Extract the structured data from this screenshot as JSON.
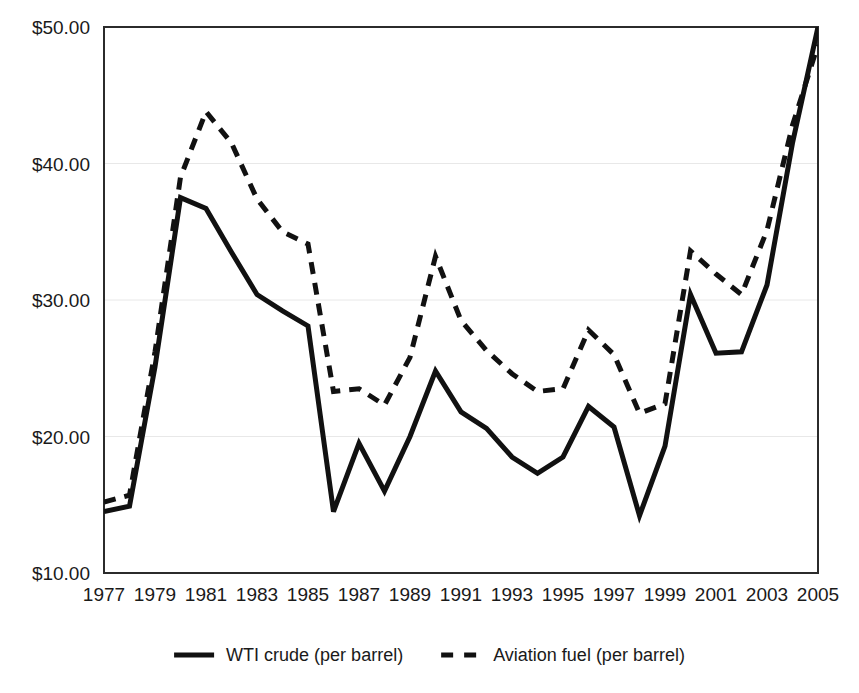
{
  "chart_data": {
    "type": "line",
    "title": "",
    "subtitle": "",
    "xlabel": "",
    "ylabel": "",
    "xlim": [
      1977,
      2005
    ],
    "ylim": [
      10,
      50
    ],
    "y_tick_labels": [
      "$50.00",
      "$40.00",
      "$30.00",
      "$20.00",
      "$10.00"
    ],
    "y_ticks": [
      50,
      40,
      30,
      20,
      10
    ],
    "x_tick_labels": [
      "1977",
      "1979",
      "1981",
      "1983",
      "1985",
      "1987",
      "1989",
      "1991",
      "1993",
      "1995",
      "1997",
      "1999",
      "2001",
      "2003",
      "2005"
    ],
    "x_ticks": [
      1977,
      1979,
      1981,
      1983,
      1985,
      1987,
      1989,
      1991,
      1993,
      1995,
      1997,
      1999,
      2001,
      2003,
      2005
    ],
    "x": [
      1977,
      1978,
      1979,
      1980,
      1981,
      1982,
      1983,
      1984,
      1985,
      1986,
      1987,
      1988,
      1989,
      1990,
      1991,
      1992,
      1993,
      1994,
      1995,
      1996,
      1997,
      1998,
      1999,
      2000,
      2001,
      2002,
      2003,
      2004,
      2005
    ],
    "grid": true,
    "grid_axis": "y",
    "legend_position": "bottom",
    "series": [
      {
        "name": "WTI crude (per barrel)",
        "style": "solid",
        "color": "#111111",
        "values": [
          14.5,
          14.9,
          25.1,
          37.5,
          36.7,
          33.5,
          30.4,
          29.2,
          28.1,
          14.5,
          19.5,
          16.0,
          20.0,
          24.8,
          21.8,
          20.6,
          18.5,
          17.3,
          18.5,
          22.2,
          20.7,
          14.2,
          19.3,
          30.4,
          26.1,
          26.2,
          31.1,
          41.5,
          50.0
        ]
      },
      {
        "name": "Aviation fuel (per barrel)",
        "style": "dashed",
        "color": "#111111",
        "values": [
          15.2,
          15.7,
          26.2,
          39.0,
          43.8,
          41.5,
          37.4,
          35.0,
          34.1,
          23.3,
          23.5,
          22.3,
          25.8,
          33.2,
          28.5,
          26.3,
          24.6,
          23.3,
          23.5,
          27.8,
          26.0,
          21.7,
          22.4,
          33.6,
          31.9,
          30.4,
          35.1,
          42.8,
          48.7
        ]
      }
    ]
  },
  "legend": {
    "entries": [
      {
        "label": "WTI crude (per barrel)",
        "style": "solid"
      },
      {
        "label": "Aviation fuel (per barrel)",
        "style": "dashed"
      }
    ]
  }
}
